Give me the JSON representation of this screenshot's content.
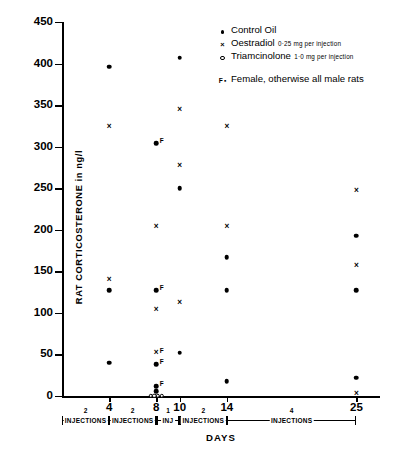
{
  "axes": {
    "ylabel": "RAT CORTICOSTERONE  in  ng/l",
    "xlabel": "DAYS",
    "yticks": [
      0,
      50,
      100,
      150,
      200,
      250,
      300,
      350,
      400,
      450
    ],
    "xticks": [
      4,
      8,
      10,
      14,
      25
    ]
  },
  "legend": {
    "items": [
      {
        "marker": "filled-circle",
        "label": "Control  Oil",
        "dose": ""
      },
      {
        "marker": "cross",
        "label": "Oestradiol",
        "dose": "0·25   mg per injection"
      },
      {
        "marker": "open-circle",
        "label": "Triamcinolone",
        "dose": "1·0 mg per injection"
      },
      {
        "marker": "f-letter",
        "label": "Female, otherwise all  male  rats",
        "dose": ""
      }
    ]
  },
  "injection_periods": [
    {
      "count": "2",
      "label": "INJECTIONS",
      "from": 0,
      "to": 4
    },
    {
      "count": "2",
      "label": "INJECTIONS",
      "from": 4,
      "to": 8
    },
    {
      "count": "1",
      "label": "INJ",
      "from": 8,
      "to": 10
    },
    {
      "count": "2",
      "label": "INJECTIONS",
      "from": 10,
      "to": 14
    },
    {
      "count": "4",
      "label": "INJECTIONS",
      "from": 14,
      "to": 25
    }
  ],
  "chart_data": {
    "type": "scatter",
    "title": "",
    "xlabel": "DAYS",
    "ylabel": "RAT CORTICOSTERONE in ng/l",
    "xlim": [
      0,
      27
    ],
    "ylim": [
      0,
      450
    ],
    "grid": false,
    "legend_position": "top-right",
    "series": [
      {
        "name": "Control Oil",
        "marker": "filled-circle",
        "points": [
          {
            "x": 4,
            "y": 396
          },
          {
            "x": 4,
            "y": 127
          },
          {
            "x": 4,
            "y": 40
          },
          {
            "x": 8,
            "y": 304,
            "note": "F"
          },
          {
            "x": 8,
            "y": 127,
            "note": "F"
          },
          {
            "x": 8,
            "y": 38,
            "note": "F"
          },
          {
            "x": 8,
            "y": 12,
            "note": "F"
          },
          {
            "x": 8,
            "y": 6
          },
          {
            "x": 10,
            "y": 407
          },
          {
            "x": 10,
            "y": 250
          },
          {
            "x": 10,
            "y": 52
          },
          {
            "x": 14,
            "y": 167
          },
          {
            "x": 14,
            "y": 127
          },
          {
            "x": 14,
            "y": 18
          },
          {
            "x": 25,
            "y": 193
          },
          {
            "x": 25,
            "y": 127
          },
          {
            "x": 25,
            "y": 22
          }
        ]
      },
      {
        "name": "Oestradiol 0·25 mg per injection",
        "marker": "cross",
        "points": [
          {
            "x": 4,
            "y": 324
          },
          {
            "x": 4,
            "y": 140
          },
          {
            "x": 8,
            "y": 203
          },
          {
            "x": 8,
            "y": 104
          },
          {
            "x": 8,
            "y": 52,
            "note": "F"
          },
          {
            "x": 10,
            "y": 344
          },
          {
            "x": 10,
            "y": 277
          },
          {
            "x": 10,
            "y": 112
          },
          {
            "x": 14,
            "y": 324
          },
          {
            "x": 14,
            "y": 203
          },
          {
            "x": 25,
            "y": 247
          },
          {
            "x": 25,
            "y": 157
          },
          {
            "x": 25,
            "y": 3
          }
        ]
      },
      {
        "name": "Triamcinolone 1·0 mg per injection",
        "marker": "open-circle",
        "points": [
          {
            "x": 7.55,
            "y": 0
          },
          {
            "x": 7.85,
            "y": 0
          },
          {
            "x": 8.15,
            "y": 0
          },
          {
            "x": 8.45,
            "y": 0
          }
        ]
      }
    ]
  }
}
